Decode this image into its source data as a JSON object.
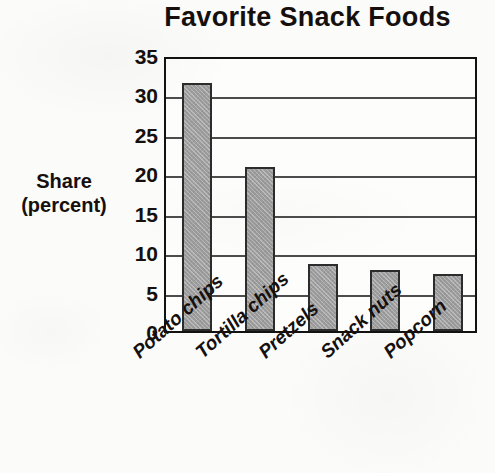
{
  "chart_data": {
    "type": "bar",
    "title": "Favorite Snack Foods",
    "xlabel": "",
    "ylabel": "Share (percent)",
    "ylabel_lines": [
      "Share",
      "(percent)"
    ],
    "categories": [
      "Potato chips",
      "Tortilla chips",
      "Pretzels",
      "Snack nuts",
      "Popcorn"
    ],
    "values": [
      31.5,
      20.8,
      8.5,
      7.7,
      7.2
    ],
    "ylim": [
      0,
      35
    ],
    "yticks": [
      0,
      5,
      10,
      15,
      20,
      25,
      30,
      35
    ],
    "ytick_labels": [
      "0",
      "5",
      "10",
      "15",
      "20",
      "25",
      "30",
      "35"
    ],
    "grid": true,
    "grid_axis": "y",
    "legend": false,
    "bar_color": "#9d9d9d",
    "bar_edge_color": "#2c2c2c",
    "background_color": "#fbfbfa",
    "text_color": "#15100e"
  }
}
